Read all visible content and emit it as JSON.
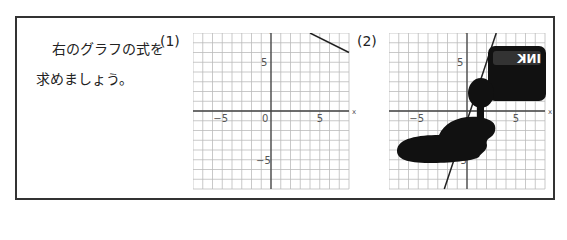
{
  "question": {
    "line1": "右のグラフの式を",
    "line2": "求めましょう。"
  },
  "graphs": [
    {
      "label": "(1)",
      "x_label": "x",
      "y_label": "y",
      "ticks": {
        "x_neg": "−5",
        "origin": "0",
        "x_pos": "5",
        "y_pos": "5",
        "y_neg": "−5"
      },
      "range": [
        -8,
        8
      ],
      "line": {
        "from": [
          4,
          8
        ],
        "to": [
          8,
          6
        ]
      },
      "obscured": false
    },
    {
      "label": "(2)",
      "x_label": "x",
      "y_label": "y",
      "ticks": {
        "x_neg": "−5",
        "x_pos": "5",
        "y_pos": "5",
        "y_neg": "−5"
      },
      "range": [
        -8,
        8
      ],
      "line": {
        "from": [
          -2.33,
          -8
        ],
        "to": [
          3,
          8
        ]
      },
      "obscured": true,
      "ink_bottle_text": "INK"
    }
  ],
  "colors": {
    "border": "#333333",
    "grid": "#bbbbbb",
    "axis": "#444444",
    "line": "#222222",
    "ink": "#111111"
  }
}
